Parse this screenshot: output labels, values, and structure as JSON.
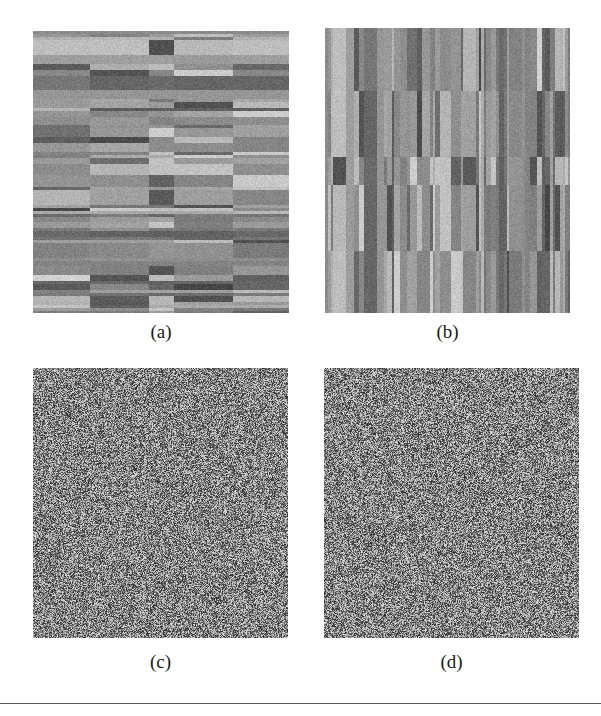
{
  "figure": {
    "type": "image-grid",
    "panel_count": 4,
    "background_color": "#ffffff",
    "rule_color": "#5a5a5a",
    "panels": [
      {
        "id": "a",
        "caption": "(a)",
        "texture": "horizontal-stripe-block",
        "description": "Block-structured grayscale texture with horizontal stripes",
        "orientation": "horizontal",
        "mean_gray": 128,
        "stripe_count": 96,
        "block_columns": [
          0.0,
          0.22,
          0.45,
          0.55,
          0.78,
          1.0
        ],
        "seed": 19371,
        "pixel_size": [
          256,
          282
        ]
      },
      {
        "id": "b",
        "caption": "(b)",
        "texture": "vertical-stripe-block",
        "description": "Block-structured grayscale texture with vertical stripes (transpose of panel a)",
        "orientation": "vertical",
        "mean_gray": 128,
        "stripe_count": 96,
        "block_columns": [
          0.0,
          0.22,
          0.45,
          0.55,
          0.78,
          1.0
        ],
        "seed": 19371,
        "pixel_size": [
          245,
          285
        ]
      },
      {
        "id": "c",
        "caption": "(c)",
        "texture": "uniform-random-noise",
        "description": "Uniformly distributed random grayscale noise",
        "orientation": "none",
        "mean_gray": 128,
        "noise_range": [
          40,
          225
        ],
        "seed": 5521,
        "pixel_size": [
          255,
          270
        ]
      },
      {
        "id": "d",
        "caption": "(d)",
        "texture": "uniform-random-noise",
        "description": "Uniformly distributed random grayscale noise",
        "orientation": "none",
        "mean_gray": 128,
        "noise_range": [
          40,
          225
        ],
        "seed": 8837,
        "pixel_size": [
          255,
          270
        ]
      }
    ]
  },
  "chart_data": {
    "type": "heatmap",
    "title": "",
    "xlabel": "",
    "ylabel": "",
    "grid": false,
    "legend": "none",
    "subplots": [
      {
        "label": "(a)",
        "kind": "heatmap",
        "colormap": "gray",
        "vmin": 0,
        "vmax": 255,
        "rows": 96,
        "cols": 128,
        "structure": "row-wise stripes partitioned into 5 column blocks",
        "column_block_edges": [
          0,
          28,
          58,
          70,
          100,
          128
        ],
        "row_band_means": [
          145,
          150,
          118,
          132,
          160,
          108,
          128,
          170,
          120,
          112,
          138,
          126,
          188,
          100,
          142,
          134,
          108,
          152,
          122,
          178,
          114,
          146,
          130,
          160,
          104,
          140,
          168,
          118,
          128,
          150,
          110,
          136,
          156,
          124,
          172,
          106,
          144,
          132,
          162,
          116,
          148,
          126,
          180,
          102,
          138,
          158,
          120,
          142,
          134,
          166,
          112,
          150,
          128,
          174,
          108,
          140,
          154,
          122,
          136,
          164,
          118,
          146,
          130,
          176,
          104,
          142,
          152,
          126,
          138,
          168,
          114,
          148,
          132,
          158,
          110,
          144,
          170,
          120,
          134,
          156,
          122,
          140,
          162,
          116,
          150,
          128,
          178,
          106,
          146,
          136,
          160,
          124,
          142,
          152,
          130,
          166
        ]
      },
      {
        "label": "(b)",
        "kind": "heatmap",
        "colormap": "gray",
        "vmin": 0,
        "vmax": 255,
        "rows": 128,
        "cols": 96,
        "structure": "column-wise stripes partitioned into 5 row blocks (transpose of (a))",
        "row_block_edges": [
          0,
          28,
          58,
          70,
          100,
          128
        ]
      },
      {
        "label": "(c)",
        "kind": "heatmap",
        "colormap": "gray",
        "vmin": 0,
        "vmax": 255,
        "rows": 128,
        "cols": 128,
        "structure": "i.i.d. uniform random noise",
        "mean": 128,
        "std": 52
      },
      {
        "label": "(d)",
        "kind": "heatmap",
        "colormap": "gray",
        "vmin": 0,
        "vmax": 255,
        "rows": 128,
        "cols": 128,
        "structure": "i.i.d. uniform random noise",
        "mean": 128,
        "std": 52
      }
    ]
  }
}
